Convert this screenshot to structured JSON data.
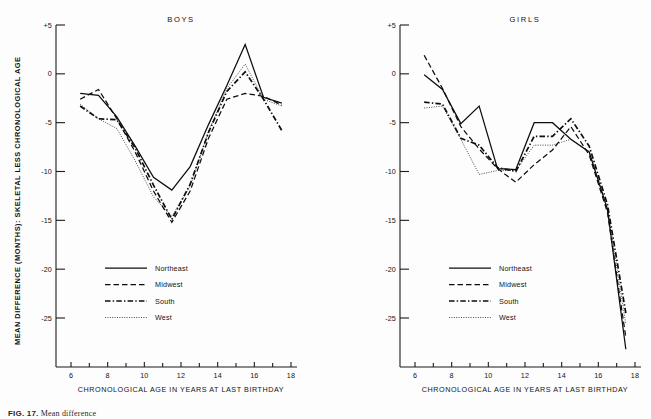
{
  "figure": {
    "caption_label": "FIG. 17.",
    "caption_text": "Mean difference",
    "y_axis_title": "MEAN DIFFERENCE (MONTHS): SKELETAL LESS CHRONOLOGICAL AGE",
    "x_axis_title": "CHRONOLOGICAL AGE IN YEARS AT LAST BIRTHDAY",
    "ink_color": "#0d0d0d",
    "background_color": "#fdfdfd"
  },
  "legend": {
    "items": [
      {
        "label": "Northeast",
        "style": "solid"
      },
      {
        "label": "Midwest",
        "style": "dashed"
      },
      {
        "label": "South",
        "style": "dashdot"
      },
      {
        "label": "West",
        "style": "dotted"
      }
    ]
  },
  "axes": {
    "y_ticks": [
      "+5",
      "0",
      "-5",
      "-10",
      "-15",
      "-20",
      "-25"
    ],
    "y_tick_values": [
      5,
      0,
      -5,
      -10,
      -15,
      -20,
      -25
    ],
    "x_ticks": [
      "6",
      "8",
      "10",
      "12",
      "14",
      "16",
      "18"
    ],
    "x_tick_values": [
      6,
      8,
      10,
      12,
      14,
      16,
      18
    ],
    "x_minor_values": [
      7,
      9,
      11,
      13,
      15,
      17
    ],
    "ylim": [
      -29,
      5
    ],
    "xlim": [
      5.4,
      18.2
    ]
  },
  "chart_data": [
    {
      "type": "line",
      "title": "BOYS",
      "xlabel": "CHRONOLOGICAL AGE IN YEARS AT LAST BIRTHDAY",
      "ylabel": "MEAN DIFFERENCE (MONTHS): SKELETAL LESS CHRONOLOGICAL AGE",
      "xlim": [
        5.4,
        18.2
      ],
      "ylim": [
        -29,
        5
      ],
      "grid": false,
      "legend_position": "lower-left",
      "series": [
        {
          "name": "Northeast",
          "style": "solid",
          "x": [
            6.5,
            7.5,
            8.5,
            9.5,
            10.5,
            11.5,
            12.5,
            13.5,
            14.5,
            15.5,
            16.5,
            17.5
          ],
          "y": [
            -2.0,
            -2.2,
            -4.4,
            -7.4,
            -10.6,
            -11.9,
            -9.5,
            -5.2,
            -1.2,
            3.0,
            -2.4,
            -3.0
          ]
        },
        {
          "name": "Midwest",
          "style": "dashed",
          "x": [
            6.5,
            7.5,
            8.5,
            9.5,
            10.5,
            11.5,
            12.5,
            13.5,
            14.5,
            15.5,
            16.5,
            17.5
          ],
          "y": [
            -2.6,
            -1.6,
            -4.6,
            -8.0,
            -12.0,
            -15.2,
            -12.0,
            -6.6,
            -2.6,
            -2.0,
            -2.3,
            -3.2
          ]
        },
        {
          "name": "South",
          "style": "dashdot",
          "x": [
            6.5,
            7.5,
            8.5,
            9.5,
            10.5,
            11.5,
            12.5,
            13.5,
            14.5,
            15.5,
            16.5,
            17.5
          ],
          "y": [
            -3.3,
            -4.6,
            -4.7,
            -7.6,
            -11.4,
            -14.9,
            -11.3,
            -6.0,
            -1.8,
            0.2,
            -2.6,
            -5.8
          ]
        },
        {
          "name": "West",
          "style": "dotted",
          "x": [
            6.5,
            7.5,
            8.5,
            9.5,
            10.5,
            11.5,
            12.5,
            13.5,
            14.5,
            15.5,
            16.5,
            17.5
          ],
          "y": [
            -3.1,
            -4.6,
            -5.6,
            -8.9,
            -12.6,
            -14.6,
            -11.5,
            -5.9,
            -1.5,
            1.0,
            -2.6,
            -3.3
          ]
        }
      ]
    },
    {
      "type": "line",
      "title": "GIRLS",
      "xlabel": "CHRONOLOGICAL AGE IN YEARS AT LAST BIRTHDAY",
      "ylabel": "MEAN DIFFERENCE (MONTHS): SKELETAL LESS CHRONOLOGICAL AGE",
      "xlim": [
        5.4,
        18.2
      ],
      "ylim": [
        -29,
        5
      ],
      "grid": false,
      "legend_position": "lower-left",
      "series": [
        {
          "name": "Northeast",
          "style": "solid",
          "x": [
            6.5,
            7.5,
            8.5,
            9.5,
            10.5,
            11.5,
            12.5,
            13.5,
            14.5,
            15.5,
            16.5,
            17.5
          ],
          "y": [
            -0.1,
            -1.6,
            -5.1,
            -3.3,
            -9.7,
            -9.8,
            -5.0,
            -5.0,
            -6.7,
            -8.0,
            -13.9,
            -28.2
          ]
        },
        {
          "name": "Midwest",
          "style": "dashed",
          "x": [
            6.5,
            7.5,
            8.5,
            9.5,
            10.5,
            11.5,
            12.5,
            13.5,
            14.5,
            15.5,
            16.5,
            17.5
          ],
          "y": [
            1.9,
            -1.5,
            -5.4,
            -7.7,
            -9.7,
            -11.1,
            -9.3,
            -7.8,
            -5.4,
            -8.3,
            -14.2,
            -27.0
          ]
        },
        {
          "name": "South",
          "style": "dashdot",
          "x": [
            6.5,
            7.5,
            8.5,
            9.5,
            10.5,
            11.5,
            12.5,
            13.5,
            14.5,
            15.5,
            16.5,
            17.5
          ],
          "y": [
            -2.9,
            -3.1,
            -6.6,
            -7.3,
            -9.6,
            -10.0,
            -6.4,
            -6.4,
            -4.6,
            -7.4,
            -13.4,
            -24.5
          ]
        },
        {
          "name": "West",
          "style": "dotted",
          "x": [
            6.5,
            7.5,
            8.5,
            9.5,
            10.5,
            11.5,
            12.5,
            13.5,
            14.5,
            15.5,
            16.5,
            17.5
          ],
          "y": [
            -3.5,
            -3.3,
            -6.7,
            -10.3,
            -9.9,
            -9.9,
            -7.3,
            -7.3,
            -6.7,
            -8.0,
            -13.8,
            -25.6
          ]
        }
      ]
    }
  ]
}
